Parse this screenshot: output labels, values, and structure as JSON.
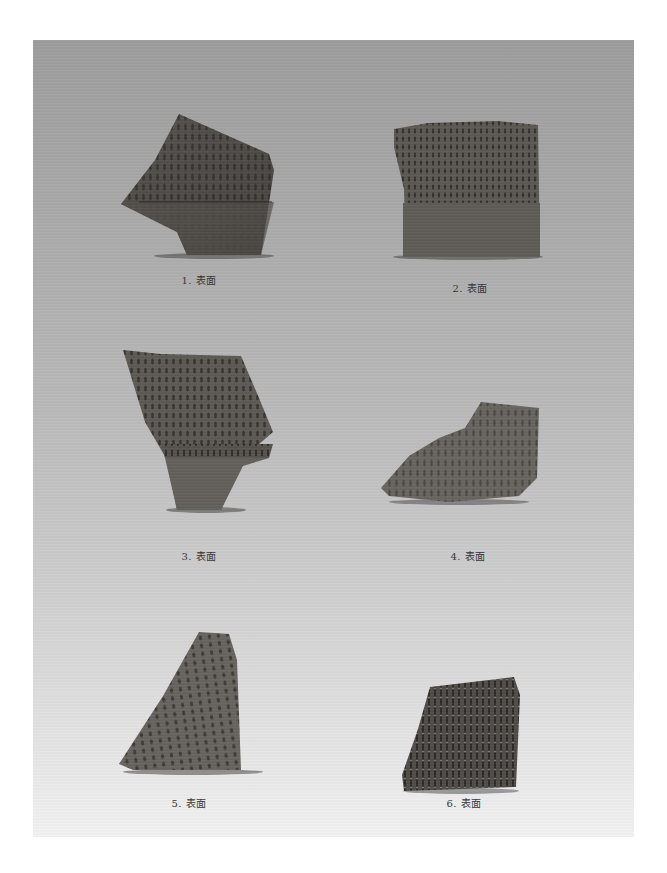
{
  "page": {
    "figures": [
      {
        "number": "1",
        "caption": "1. 表面"
      },
      {
        "number": "2",
        "caption": "2. 表面"
      },
      {
        "number": "3",
        "caption": "3. 表面"
      },
      {
        "number": "4",
        "caption": "4. 表面"
      },
      {
        "number": "5",
        "caption": "5. 表面"
      },
      {
        "number": "6",
        "caption": "6. 表面"
      }
    ]
  }
}
